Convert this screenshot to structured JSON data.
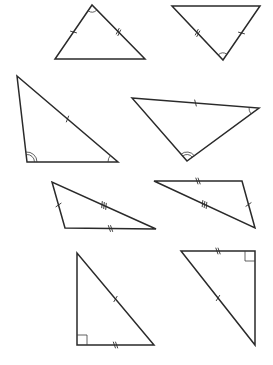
{
  "diagram": {
    "background": "#ffffff",
    "stroke_color": "#2a2a2a",
    "triangles": [
      {
        "id": "t1",
        "vertices": [
          [
            92,
            5
          ],
          [
            55,
            59
          ],
          [
            145,
            59
          ]
        ],
        "ticks": [
          {
            "edge": [
              0,
              1
            ],
            "count": 1
          },
          {
            "edge": [
              0,
              2
            ],
            "count": 2
          }
        ],
        "angles": [
          {
            "vertex": 0,
            "arcs": 1,
            "r": 7
          }
        ],
        "right_angle": null
      },
      {
        "id": "t2",
        "vertices": [
          [
            172,
            6
          ],
          [
            260,
            6
          ],
          [
            223,
            60
          ]
        ],
        "ticks": [
          {
            "edge": [
              0,
              2
            ],
            "count": 2
          },
          {
            "edge": [
              1,
              2
            ],
            "count": 1
          }
        ],
        "angles": [
          {
            "vertex": 2,
            "arcs": 1,
            "r": 7
          }
        ],
        "right_angle": null
      },
      {
        "id": "t3",
        "vertices": [
          [
            17,
            76
          ],
          [
            27,
            162
          ],
          [
            118,
            162
          ]
        ],
        "ticks": [
          {
            "edge": [
              0,
              2
            ],
            "count": 1
          }
        ],
        "angles": [
          {
            "vertex": 1,
            "arcs": 2,
            "r": 10
          },
          {
            "vertex": 2,
            "arcs": 1,
            "r": 10
          }
        ],
        "right_angle": null
      },
      {
        "id": "t4",
        "vertices": [
          [
            132,
            98
          ],
          [
            259,
            108
          ],
          [
            187,
            161
          ]
        ],
        "ticks": [
          {
            "edge": [
              0,
              1
            ],
            "count": 1
          }
        ],
        "angles": [
          {
            "vertex": 2,
            "arcs": 2,
            "r": 9
          },
          {
            "vertex": 1,
            "arcs": 1,
            "r": 10
          }
        ],
        "right_angle": null
      },
      {
        "id": "t5",
        "vertices": [
          [
            52,
            182
          ],
          [
            65,
            228
          ],
          [
            156,
            229
          ]
        ],
        "ticks": [
          {
            "edge": [
              0,
              1
            ],
            "count": 1
          },
          {
            "edge": [
              0,
              2
            ],
            "count": 3
          },
          {
            "edge": [
              1,
              2
            ],
            "count": 2
          }
        ],
        "angles": [],
        "right_angle": null
      },
      {
        "id": "t6",
        "vertices": [
          [
            154,
            181
          ],
          [
            242,
            181
          ],
          [
            255,
            228
          ]
        ],
        "ticks": [
          {
            "edge": [
              0,
              1
            ],
            "count": 2
          },
          {
            "edge": [
              0,
              2
            ],
            "count": 3
          },
          {
            "edge": [
              1,
              2
            ],
            "count": 1
          }
        ],
        "angles": [],
        "right_angle": null
      },
      {
        "id": "t7",
        "vertices": [
          [
            77,
            253
          ],
          [
            77,
            345
          ],
          [
            154,
            345
          ]
        ],
        "ticks": [
          {
            "edge": [
              0,
              2
            ],
            "count": 1
          },
          {
            "edge": [
              1,
              2
            ],
            "count": 2
          }
        ],
        "angles": [],
        "right_angle": {
          "vertex": 1,
          "size": 10
        }
      },
      {
        "id": "t8",
        "vertices": [
          [
            181,
            251
          ],
          [
            255,
            251
          ],
          [
            255,
            345
          ]
        ],
        "ticks": [
          {
            "edge": [
              0,
              1
            ],
            "count": 2
          },
          {
            "edge": [
              0,
              2
            ],
            "count": 1
          }
        ],
        "angles": [],
        "right_angle": {
          "vertex": 1,
          "size": 10
        }
      }
    ]
  }
}
